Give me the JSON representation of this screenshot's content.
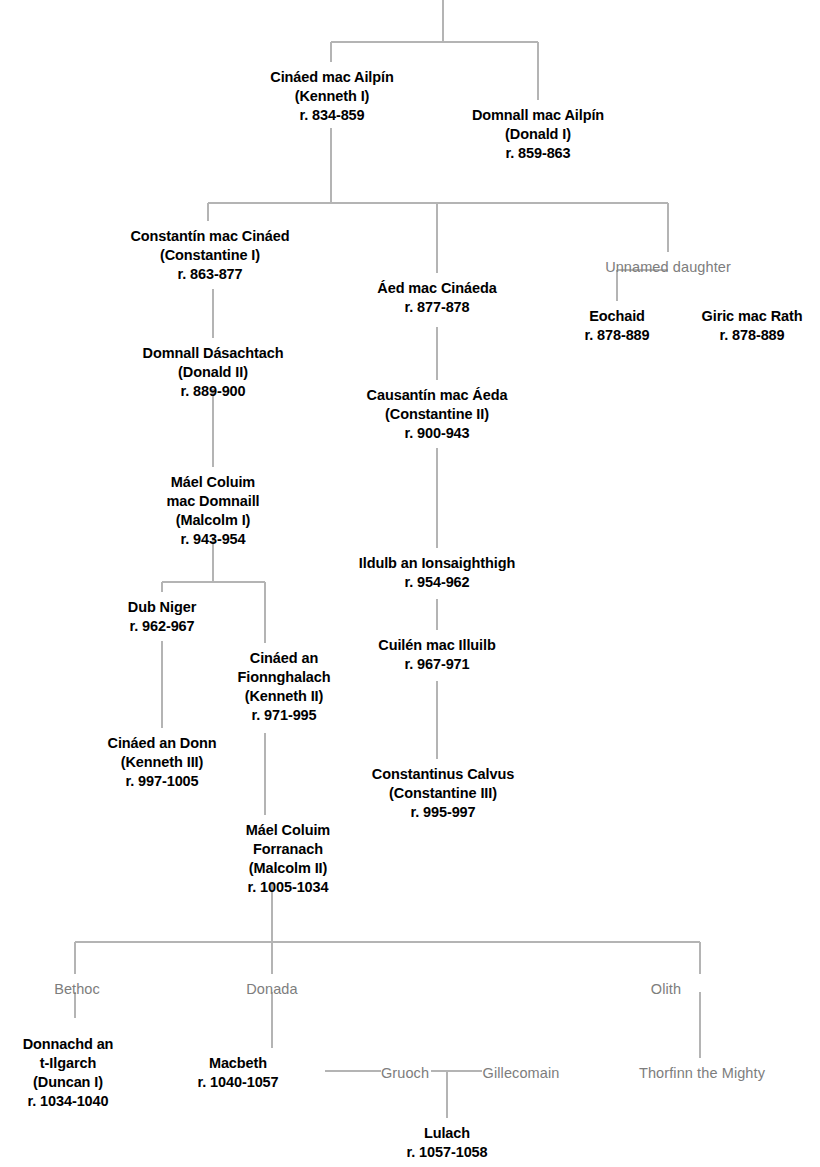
{
  "chart_data": {
    "type": "diagram",
    "style": {
      "king_color": "#000000",
      "consort_color": "#7d7d7d",
      "line_color": "#b4b4b4",
      "background": "#ffffff"
    },
    "nodes": [
      {
        "id": "kenneth1",
        "type": "king",
        "x": 332,
        "y": 68,
        "lines": [
          "Cináed mac Ailpín",
          "(Kenneth I)",
          "r. 834-859"
        ]
      },
      {
        "id": "donald1",
        "type": "king",
        "x": 538,
        "y": 106,
        "lines": [
          "Domnall mac Ailpín",
          "(Donald I)",
          "r. 859-863"
        ]
      },
      {
        "id": "constantine1",
        "type": "king",
        "x": 210,
        "y": 227,
        "lines": [
          "Constantín mac Cináed",
          "(Constantine I)",
          "r. 863-877"
        ]
      },
      {
        "id": "aed",
        "type": "king",
        "x": 437,
        "y": 279,
        "lines": [
          "Áed mac Cináeda",
          "r. 877-878"
        ]
      },
      {
        "id": "unnamed_dau",
        "type": "consort",
        "x": 668,
        "y": 258,
        "lines": [
          "Unnamed daughter"
        ]
      },
      {
        "id": "eochaid",
        "type": "king",
        "x": 617,
        "y": 307,
        "lines": [
          "Eochaid",
          "r. 878-889"
        ]
      },
      {
        "id": "giric",
        "type": "king",
        "x": 752,
        "y": 307,
        "lines": [
          "Giric mac Rath",
          "r. 878-889"
        ]
      },
      {
        "id": "donald2",
        "type": "king",
        "x": 213,
        "y": 344,
        "lines": [
          "Domnall Dásachtach",
          "(Donald II)",
          "r. 889-900"
        ]
      },
      {
        "id": "constantine2",
        "type": "king",
        "x": 437,
        "y": 386,
        "lines": [
          "Causantín mac Áeda",
          "(Constantine II)",
          "r. 900-943"
        ]
      },
      {
        "id": "malcolm1",
        "type": "king",
        "x": 213,
        "y": 473,
        "lines": [
          "Máel Coluim",
          "mac Domnaill",
          "(Malcolm I)",
          "r. 943-954"
        ]
      },
      {
        "id": "ildulb",
        "type": "king",
        "x": 437,
        "y": 554,
        "lines": [
          "Ildulb an Ionsaighthigh",
          "r. 954-962"
        ]
      },
      {
        "id": "dubniger",
        "type": "king",
        "x": 162,
        "y": 598,
        "lines": [
          "Dub Niger",
          "r. 962-967"
        ]
      },
      {
        "id": "kenneth2",
        "type": "king",
        "x": 284,
        "y": 649,
        "lines": [
          "Cináed an",
          "Fionnghalach",
          "(Kenneth II)",
          "r. 971-995"
        ]
      },
      {
        "id": "cuilen",
        "type": "king",
        "x": 437,
        "y": 636,
        "lines": [
          "Cuilén mac Illuilb",
          "r. 967-971"
        ]
      },
      {
        "id": "kenneth3",
        "type": "king",
        "x": 162,
        "y": 734,
        "lines": [
          "Cináed an Donn",
          "(Kenneth III)",
          "r. 997-1005"
        ]
      },
      {
        "id": "constantine3",
        "type": "king",
        "x": 443,
        "y": 765,
        "lines": [
          "Constantinus Calvus",
          "(Constantine III)",
          "r. 995-997"
        ]
      },
      {
        "id": "malcolm2",
        "type": "king",
        "x": 288,
        "y": 821,
        "lines": [
          "Máel Coluim",
          "Forranach",
          "(Malcolm II)",
          "r. 1005-1034"
        ]
      },
      {
        "id": "bethoc",
        "type": "consort",
        "x": 77,
        "y": 980,
        "lines": [
          "Bethoc"
        ]
      },
      {
        "id": "donada",
        "type": "consort",
        "x": 272,
        "y": 980,
        "lines": [
          "Donada"
        ]
      },
      {
        "id": "olith",
        "type": "consort",
        "x": 666,
        "y": 980,
        "lines": [
          "Olith"
        ]
      },
      {
        "id": "duncan1",
        "type": "king",
        "x": 68,
        "y": 1035,
        "lines": [
          "Donnachd an",
          "t-Ilgarch",
          "(Duncan I)",
          "r. 1034-1040"
        ]
      },
      {
        "id": "macbeth",
        "type": "king",
        "x": 238,
        "y": 1054,
        "lines": [
          "Macbeth",
          "r. 1040-1057"
        ]
      },
      {
        "id": "gruoch",
        "type": "consort",
        "x": 405,
        "y": 1064,
        "lines": [
          "Gruoch"
        ]
      },
      {
        "id": "gillecomain",
        "type": "consort",
        "x": 521,
        "y": 1064,
        "lines": [
          "Gillecomain"
        ]
      },
      {
        "id": "thorfinn",
        "type": "consort",
        "x": 702,
        "y": 1064,
        "lines": [
          "Thorfinn the Mighty"
        ]
      },
      {
        "id": "lulach",
        "type": "king",
        "x": 447,
        "y": 1124,
        "lines": [
          "Lulach",
          "r. 1057-1058"
        ]
      }
    ],
    "connectors": [
      {
        "id": "root-stub",
        "type": "v",
        "x": 443,
        "y1": 0,
        "y2": 42
      },
      {
        "id": "gen1-bar",
        "type": "h",
        "y": 42,
        "x1": 331,
        "x2": 538
      },
      {
        "id": "kenneth1-drop",
        "type": "v",
        "x": 331,
        "y1": 42,
        "y2": 62
      },
      {
        "id": "donald1-drop",
        "type": "v",
        "x": 538,
        "y1": 42,
        "y2": 100
      },
      {
        "id": "kenneth1-down",
        "type": "v",
        "x": 331,
        "y1": 128,
        "y2": 203
      },
      {
        "id": "gen2-bar",
        "type": "h",
        "y": 203,
        "x1": 208,
        "x2": 668
      },
      {
        "id": "constantine1-drop",
        "type": "v",
        "x": 208,
        "y1": 203,
        "y2": 221
      },
      {
        "id": "aed-drop",
        "type": "v",
        "x": 437,
        "y1": 203,
        "y2": 273
      },
      {
        "id": "unnamed-drop",
        "type": "v",
        "x": 668,
        "y1": 203,
        "y2": 252
      },
      {
        "id": "unnamed-to-eochaid",
        "type": "v",
        "x": 617,
        "y1": 270,
        "y2": 301
      },
      {
        "id": "unnamed-bar",
        "type": "h",
        "y": 270,
        "x1": 617,
        "x2": 668
      },
      {
        "id": "constantine1-down",
        "type": "v",
        "x": 213,
        "y1": 289,
        "y2": 338
      },
      {
        "id": "aed-down",
        "type": "v",
        "x": 437,
        "y1": 327,
        "y2": 380
      },
      {
        "id": "donald2-down",
        "type": "v",
        "x": 213,
        "y1": 389,
        "y2": 467
      },
      {
        "id": "constantine2-down",
        "type": "v",
        "x": 437,
        "y1": 448,
        "y2": 548
      },
      {
        "id": "malcolm1-down",
        "type": "v",
        "x": 213,
        "y1": 537,
        "y2": 582
      },
      {
        "id": "malcolm1-bar",
        "type": "h",
        "y": 582,
        "x1": 162,
        "x2": 265
      },
      {
        "id": "dubniger-drop",
        "type": "v",
        "x": 162,
        "y1": 582,
        "y2": 592
      },
      {
        "id": "kenneth2-drop",
        "type": "v",
        "x": 265,
        "y1": 582,
        "y2": 643
      },
      {
        "id": "ildulb-down",
        "type": "v",
        "x": 437,
        "y1": 599,
        "y2": 630
      },
      {
        "id": "dubniger-down",
        "type": "v",
        "x": 162,
        "y1": 641,
        "y2": 728
      },
      {
        "id": "cuilen-down",
        "type": "v",
        "x": 437,
        "y1": 681,
        "y2": 759
      },
      {
        "id": "kenneth2-down",
        "type": "v",
        "x": 265,
        "y1": 733,
        "y2": 815
      },
      {
        "id": "malcolm2-down",
        "type": "v",
        "x": 272,
        "y1": 883,
        "y2": 942
      },
      {
        "id": "gen5-bar",
        "type": "h",
        "y": 942,
        "x1": 75,
        "x2": 700
      },
      {
        "id": "bethoc-drop",
        "type": "v",
        "x": 75,
        "y1": 942,
        "y2": 974
      },
      {
        "id": "donada-drop",
        "type": "v",
        "x": 272,
        "y1": 942,
        "y2": 974
      },
      {
        "id": "olith-drop",
        "type": "v",
        "x": 700,
        "y1": 942,
        "y2": 974
      },
      {
        "id": "bethoc-down",
        "type": "v",
        "x": 75,
        "y1": 992,
        "y2": 1018
      },
      {
        "id": "donada-down",
        "type": "v",
        "x": 272,
        "y1": 992,
        "y2": 1048
      },
      {
        "id": "olith-down",
        "type": "v",
        "x": 700,
        "y1": 992,
        "y2": 1058
      },
      {
        "id": "macbeth-gruoch",
        "type": "h",
        "y": 1071,
        "x1": 325,
        "x2": 381
      },
      {
        "id": "gruoch-gillecomain",
        "type": "h",
        "y": 1071,
        "x1": 431,
        "x2": 482
      },
      {
        "id": "lulach-drop",
        "type": "v",
        "x": 447,
        "y1": 1071,
        "y2": 1118
      }
    ]
  }
}
